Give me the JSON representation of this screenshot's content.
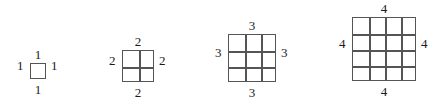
{
  "figure": {
    "background_color": "#ffffff",
    "line_color": "#555555",
    "label_color": "#1a1a1a",
    "groups": [
      {
        "name": "grid-1x1",
        "n": 1,
        "x": 30,
        "y": 63,
        "size": 16,
        "labels": {
          "top": "1",
          "right": "1",
          "bottom": "1",
          "left": "1"
        }
      },
      {
        "name": "grid-2x2",
        "n": 2,
        "x": 122,
        "y": 50,
        "size": 32,
        "labels": {
          "top": "2",
          "right": "2",
          "bottom": "2",
          "left": "2"
        }
      },
      {
        "name": "grid-3x3",
        "n": 3,
        "x": 228,
        "y": 34,
        "size": 48,
        "labels": {
          "top": "3",
          "right": "3",
          "bottom": "3",
          "left": "3"
        }
      },
      {
        "name": "grid-4x4",
        "n": 4,
        "x": 352,
        "y": 17,
        "size": 64,
        "labels": {
          "top": "4",
          "right": "4",
          "bottom": "4",
          "left": "4"
        }
      }
    ]
  }
}
